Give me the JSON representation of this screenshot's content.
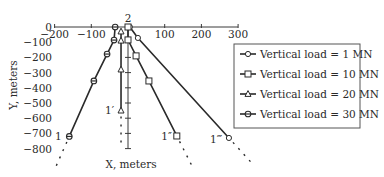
{
  "chart_data": {
    "type": "line",
    "title": "",
    "xlabel": "X, meters",
    "ylabel": "Y, meters",
    "xlim": [
      -200,
      300
    ],
    "ylim": [
      -800,
      0
    ],
    "x_ticks": [
      -200,
      -100,
      0,
      100,
      200,
      300
    ],
    "y_ticks": [
      0,
      -100,
      -200,
      -300,
      -400,
      -500,
      -600,
      -700,
      -800
    ],
    "x_tick_labels": [
      "-200",
      "-100",
      "",
      "100",
      "200",
      "300"
    ],
    "y_tick_labels": [
      "0",
      "-100",
      "-200",
      "-300",
      "-400",
      "-500",
      "-600",
      "-700",
      "-800"
    ],
    "grid": false,
    "legend_position": "right",
    "annotations": [
      {
        "text": "2",
        "x": 0,
        "y": 60
      },
      {
        "text": "1",
        "x": -190,
        "y": -720
      },
      {
        "text": "1′",
        "x": -50,
        "y": -545
      },
      {
        "text": "1″",
        "x": 105,
        "y": -720
      },
      {
        "text": "1‴",
        "x": 240,
        "y": -735
      }
    ],
    "series": [
      {
        "name": "Vertical load = 1 MN",
        "marker": "open-circle",
        "end_label": "1‴",
        "x": [
          5,
          27,
          275
        ],
        "y": [
          0,
          -72,
          -730
        ]
      },
      {
        "name": "Vertical load = 10 MN",
        "marker": "open-square",
        "end_label": "1″",
        "x": [
          0,
          0,
          22,
          57,
          133
        ],
        "y": [
          0,
          -85,
          -190,
          -355,
          -717
        ]
      },
      {
        "name": "Vertical load = 20 MN",
        "marker": "open-triangle",
        "end_label": "1′",
        "x": [
          -19,
          -19,
          -19,
          -19
        ],
        "y": [
          -30,
          -90,
          -280,
          -550
        ]
      },
      {
        "name": "Vertical load = 30 MN",
        "marker": "crossed-circle",
        "end_label": "1",
        "x": [
          -35,
          -38,
          -57,
          -93,
          -160
        ],
        "y": [
          0,
          -86,
          -178,
          -355,
          -720
        ]
      }
    ],
    "extensions": "dashed continuation beyond each end point"
  },
  "legend": {
    "items": [
      {
        "label": "Vertical load = 1 MN",
        "marker": "open-circle"
      },
      {
        "label": "Vertical load = 10 MN",
        "marker": "open-square"
      },
      {
        "label": "Vertical load = 20 MN",
        "marker": "open-triangle"
      },
      {
        "label": "Vertical load = 30 MN",
        "marker": "crossed-circle"
      }
    ]
  },
  "colors": {
    "line": "#2a2a2a",
    "axis": "#3a3a3a",
    "background": "#ffffff"
  }
}
